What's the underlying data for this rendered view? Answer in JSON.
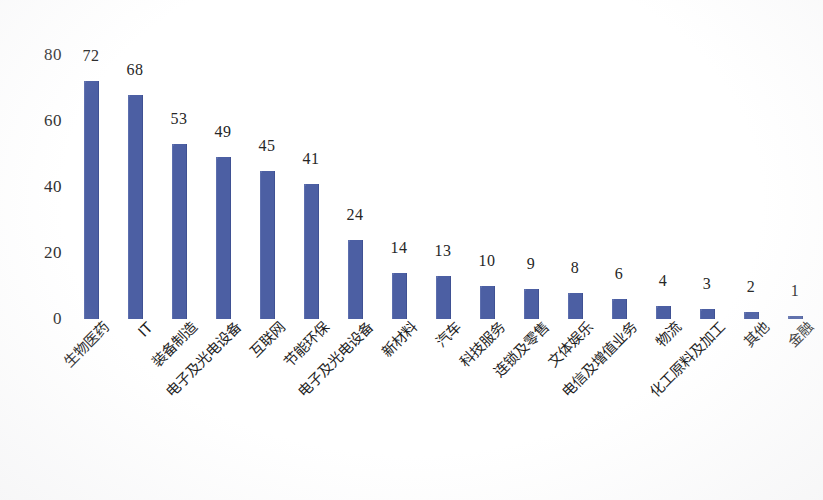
{
  "chart_data": {
    "type": "bar",
    "title": "",
    "subtitle": "",
    "xlabel": "",
    "ylabel": "",
    "ylim": [
      0,
      80
    ],
    "y_ticks": [
      0,
      20,
      40,
      60,
      80
    ],
    "grid": false,
    "legend": null,
    "bar_color": "#4C5FA3",
    "label_color": "#262626",
    "orientation": "vertical",
    "value_labels_shown": true,
    "x_tick_rotation_deg": -45,
    "categories": [
      "生物医药",
      "IT",
      "装备制造",
      "电子及光电设备",
      "互联网",
      "节能环保",
      "电子及光电设备",
      "新材料",
      "汽车",
      "科技服务",
      "连锁及零售",
      "文体娱乐",
      "电信及增值业务",
      "物流",
      "化工原料及加工",
      "其他",
      "金融"
    ],
    "values": [
      72,
      68,
      53,
      49,
      45,
      41,
      24,
      14,
      13,
      10,
      9,
      8,
      6,
      4,
      3,
      2,
      1
    ],
    "value_label_texts": [
      "72",
      "68",
      "53",
      "49",
      "45",
      "41",
      "24",
      "14",
      "13",
      "10",
      "9",
      "8",
      "6",
      "4",
      "3",
      "2",
      "1"
    ],
    "y_tick_texts": [
      "0",
      "20",
      "40",
      "60",
      "80"
    ]
  }
}
